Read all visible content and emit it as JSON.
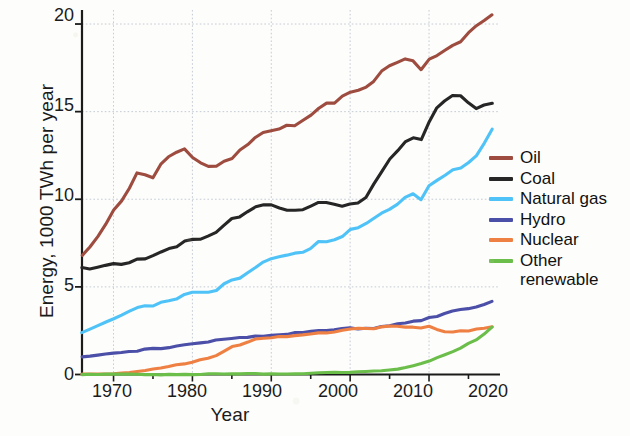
{
  "chart_data": {
    "type": "line",
    "title": "",
    "xlabel": "Year",
    "ylabel": "Energy, 1000 TWh per year",
    "xlim": [
      1966,
      2019
    ],
    "ylim": [
      0,
      20.8
    ],
    "xticks": [
      1970,
      1980,
      1990,
      2000,
      2010,
      2020
    ],
    "xtick_labels": [
      "1970",
      "1980",
      "1990",
      "2000",
      "2010",
      "2020"
    ],
    "yticks": [
      0,
      5,
      10,
      15,
      20
    ],
    "ytick_labels": [
      "0",
      "5",
      "10",
      "15",
      "20"
    ],
    "grid": true,
    "legend_position": "right",
    "x": [
      1966,
      1967,
      1968,
      1969,
      1970,
      1971,
      1972,
      1973,
      1974,
      1975,
      1976,
      1977,
      1978,
      1979,
      1980,
      1981,
      1982,
      1983,
      1984,
      1985,
      1986,
      1987,
      1988,
      1989,
      1990,
      1991,
      1992,
      1993,
      1994,
      1995,
      1996,
      1997,
      1998,
      1999,
      2000,
      2001,
      2002,
      2003,
      2004,
      2005,
      2006,
      2007,
      2008,
      2009,
      2010,
      2011,
      2012,
      2013,
      2014,
      2015,
      2016,
      2017,
      2018
    ],
    "series": [
      {
        "name": "Oil",
        "color": "#9e4c3f",
        "values": [
          6.8,
          7.3,
          7.9,
          8.6,
          9.4,
          9.9,
          10.6,
          11.5,
          11.4,
          11.2,
          12.0,
          12.4,
          12.7,
          12.9,
          12.4,
          12.1,
          11.9,
          11.9,
          12.2,
          12.3,
          12.8,
          13.1,
          13.5,
          13.8,
          13.9,
          14.0,
          14.2,
          14.2,
          14.5,
          14.8,
          15.2,
          15.5,
          15.5,
          15.9,
          16.1,
          16.2,
          16.4,
          16.7,
          17.3,
          17.6,
          17.8,
          18.0,
          17.9,
          17.4,
          18.0,
          18.2,
          18.5,
          18.8,
          19.0,
          19.5,
          19.9,
          20.2,
          20.5
        ]
      },
      {
        "name": "Coal",
        "color": "#262626",
        "values": [
          6.1,
          6.0,
          6.1,
          6.2,
          6.3,
          6.3,
          6.4,
          6.6,
          6.6,
          6.8,
          7.0,
          7.2,
          7.3,
          7.6,
          7.7,
          7.7,
          7.9,
          8.1,
          8.5,
          8.9,
          9.0,
          9.3,
          9.6,
          9.7,
          9.7,
          9.5,
          9.4,
          9.4,
          9.4,
          9.6,
          9.8,
          9.8,
          9.7,
          9.6,
          9.7,
          9.8,
          10.1,
          10.9,
          11.6,
          12.3,
          12.8,
          13.3,
          13.5,
          13.4,
          14.4,
          15.2,
          15.6,
          15.9,
          15.9,
          15.5,
          15.2,
          15.4,
          15.5
        ]
      },
      {
        "name": "Natural gas",
        "color": "#4fc3f7",
        "values": [
          2.4,
          2.6,
          2.8,
          3.0,
          3.2,
          3.4,
          3.6,
          3.8,
          3.9,
          3.9,
          4.1,
          4.2,
          4.3,
          4.6,
          4.7,
          4.7,
          4.7,
          4.8,
          5.2,
          5.4,
          5.5,
          5.8,
          6.1,
          6.4,
          6.6,
          6.7,
          6.8,
          6.9,
          7.0,
          7.2,
          7.6,
          7.6,
          7.7,
          7.9,
          8.3,
          8.4,
          8.6,
          8.9,
          9.2,
          9.4,
          9.7,
          10.1,
          10.3,
          10.0,
          10.8,
          11.1,
          11.4,
          11.7,
          11.8,
          12.1,
          12.5,
          13.2,
          14.0
        ]
      },
      {
        "name": "Hydro",
        "color": "#4b4fa8",
        "values": [
          1.0,
          1.05,
          1.1,
          1.15,
          1.2,
          1.25,
          1.3,
          1.35,
          1.45,
          1.5,
          1.5,
          1.55,
          1.65,
          1.7,
          1.75,
          1.8,
          1.85,
          1.95,
          2.0,
          2.05,
          2.1,
          2.1,
          2.2,
          2.2,
          2.25,
          2.3,
          2.3,
          2.4,
          2.4,
          2.45,
          2.5,
          2.5,
          2.55,
          2.6,
          2.65,
          2.6,
          2.65,
          2.65,
          2.75,
          2.8,
          2.9,
          2.95,
          3.05,
          3.1,
          3.25,
          3.3,
          3.45,
          3.6,
          3.7,
          3.75,
          3.85,
          4.0,
          4.2
        ]
      },
      {
        "name": "Nuclear",
        "color": "#ef8044",
        "values": [
          0.02,
          0.03,
          0.04,
          0.05,
          0.07,
          0.1,
          0.13,
          0.17,
          0.22,
          0.3,
          0.35,
          0.45,
          0.55,
          0.6,
          0.7,
          0.85,
          0.95,
          1.1,
          1.35,
          1.6,
          1.7,
          1.85,
          2.0,
          2.05,
          2.1,
          2.15,
          2.15,
          2.2,
          2.25,
          2.3,
          2.4,
          2.4,
          2.45,
          2.55,
          2.6,
          2.65,
          2.65,
          2.6,
          2.7,
          2.75,
          2.75,
          2.7,
          2.7,
          2.65,
          2.75,
          2.6,
          2.45,
          2.45,
          2.5,
          2.5,
          2.6,
          2.65,
          2.7
        ]
      },
      {
        "name": "Other renewable",
        "color": "#6cbe4b",
        "values": [
          0.0,
          0.0,
          0.0,
          0.0,
          0.0,
          0.0,
          0.0,
          0.0,
          0.0,
          0.0,
          0.0,
          0.01,
          0.01,
          0.01,
          0.01,
          0.01,
          0.02,
          0.02,
          0.02,
          0.02,
          0.03,
          0.03,
          0.03,
          0.04,
          0.04,
          0.05,
          0.05,
          0.06,
          0.06,
          0.07,
          0.08,
          0.09,
          0.1,
          0.11,
          0.12,
          0.14,
          0.16,
          0.18,
          0.22,
          0.27,
          0.33,
          0.42,
          0.52,
          0.63,
          0.78,
          0.95,
          1.12,
          1.3,
          1.5,
          1.75,
          1.95,
          2.3,
          2.7
        ]
      }
    ]
  },
  "legend": {
    "items": [
      {
        "label": "Oil",
        "color": "#9e4c3f"
      },
      {
        "label": "Coal",
        "color": "#262626"
      },
      {
        "label": "Natural gas",
        "color": "#4fc3f7"
      },
      {
        "label": "Hydro",
        "color": "#4b4fa8"
      },
      {
        "label": "Nuclear",
        "color": "#ef8044"
      },
      {
        "label": "Other\nrenewable",
        "color": "#6cbe4b"
      }
    ]
  }
}
